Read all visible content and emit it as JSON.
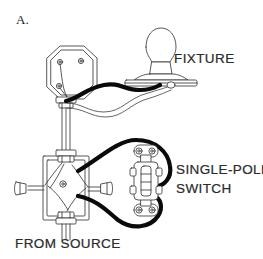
{
  "figure": {
    "panel_label": "A."
  },
  "labels": {
    "fixture": "FIXTURE",
    "switch_line1": "SINGLE-POLE",
    "switch_line2": "SWITCH",
    "source": "FROM SOURCE"
  },
  "components": {
    "ceiling_box": {
      "name": "octagonal ceiling box",
      "shape": "octagon",
      "screw_hole_count": 3
    },
    "fixture": {
      "name": "lighting fixture",
      "parts": [
        "globe",
        "neck",
        "canopy plate"
      ]
    },
    "junction_box": {
      "name": "rectangular junction box",
      "wire_nut_count": 2,
      "cable_clamp_count": 2
    },
    "switch": {
      "name": "single-pole toggle switch",
      "mounting_screw_count": 2,
      "terminal_screw_count": 4,
      "toggle_position": "up"
    },
    "cable_from_source": {
      "name": "supply cable from source"
    }
  },
  "colors": {
    "background": "#ffffff",
    "line": "#3a3a3a",
    "hot_wire": "#0a0a0a",
    "neutral_wire": "#4a4a4a",
    "text": "#2b2b2b"
  }
}
